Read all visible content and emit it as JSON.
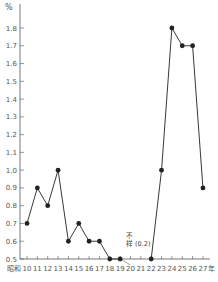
{
  "chart_data": {
    "type": "line",
    "title": "",
    "xlabel": "",
    "ylabel": "%",
    "x_prefix": "昭和",
    "x_suffix": "年",
    "categories": [
      "10",
      "11",
      "12",
      "13",
      "14",
      "15",
      "16",
      "17",
      "18",
      "19",
      "20",
      "21",
      "22",
      "23",
      "24",
      "25",
      "26",
      "27"
    ],
    "values": [
      0.7,
      0.9,
      0.8,
      1.0,
      0.6,
      0.7,
      0.6,
      0.6,
      0.5,
      0.5,
      null,
      null,
      0.5,
      1.0,
      1.8,
      1.7,
      1.7,
      0.9
    ],
    "ylim": [
      0.5,
      1.8
    ],
    "yticks": [
      "0.5",
      "0.6",
      "0.7",
      "0.8",
      "0.9",
      "1.0",
      "1.1",
      "1.2",
      "1.3",
      "1.4",
      "1.5",
      "1.6",
      "1.7",
      "1.8"
    ],
    "grid": false,
    "annotations": [
      {
        "x": "20-21",
        "text_line1": "不",
        "text_line2": "祥 (0.2)",
        "note": "data unknown; value 0.2"
      }
    ],
    "series_color": "#222222"
  },
  "labels": {
    "y_unit": "%",
    "x_era": "昭和",
    "x_unit": "年",
    "annotation_line1": "不",
    "annotation_line2": "祥 (0.2)"
  }
}
